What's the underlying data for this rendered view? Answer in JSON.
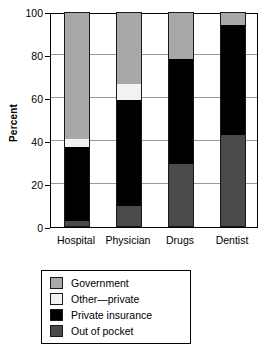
{
  "chart_data": {
    "type": "bar",
    "subtype": "stacked-bar-100-percent",
    "title": "",
    "xlabel": "",
    "ylabel": "Percent",
    "ylim": [
      0,
      100
    ],
    "yticks": [
      0,
      20,
      40,
      60,
      80,
      100
    ],
    "grid": true,
    "legend_position": "bottom",
    "categories": [
      "Hospital",
      "Physician",
      "Drugs",
      "Dentist"
    ],
    "series": [
      {
        "name": "Out of pocket",
        "color": "#4a4a4a",
        "values": [
          3,
          10,
          29.5,
          43
        ]
      },
      {
        "name": "Private insurance",
        "color": "#000000",
        "values": [
          34,
          49,
          48.5,
          51
        ]
      },
      {
        "name": "Other—private",
        "color": "#f2f2f2",
        "values": [
          4,
          7.5,
          0,
          0
        ]
      },
      {
        "name": "Government",
        "color": "#a8a8a8",
        "values": [
          59,
          33.5,
          22,
          6
        ]
      }
    ],
    "cumulative_tops": {
      "Hospital": {
        "out_of_pocket": 3,
        "private_insurance": 37,
        "other_private": 41,
        "government": 100
      },
      "Physician": {
        "out_of_pocket": 10,
        "private_insurance": 59,
        "other_private": 66.5,
        "government": 100
      },
      "Drugs": {
        "out_of_pocket": 29.5,
        "private_insurance": 78,
        "other_private": 78,
        "government": 100
      },
      "Dentist": {
        "out_of_pocket": 43,
        "private_insurance": 94,
        "other_private": 94,
        "government": 100
      }
    }
  },
  "axis": {
    "y_title": "Percent",
    "y_tick_labels": [
      "100",
      "80",
      "60",
      "40",
      "20",
      "0"
    ],
    "x_tick_labels": [
      "Hospital",
      "Physician",
      "Drugs",
      "Dentist"
    ]
  },
  "legend": {
    "items": [
      {
        "label": "Government",
        "color": "#a8a8a8"
      },
      {
        "label": "Other—private",
        "color": "#f2f2f2"
      },
      {
        "label": "Private insurance",
        "color": "#000000"
      },
      {
        "label": "Out of pocket",
        "color": "#4a4a4a"
      }
    ]
  }
}
